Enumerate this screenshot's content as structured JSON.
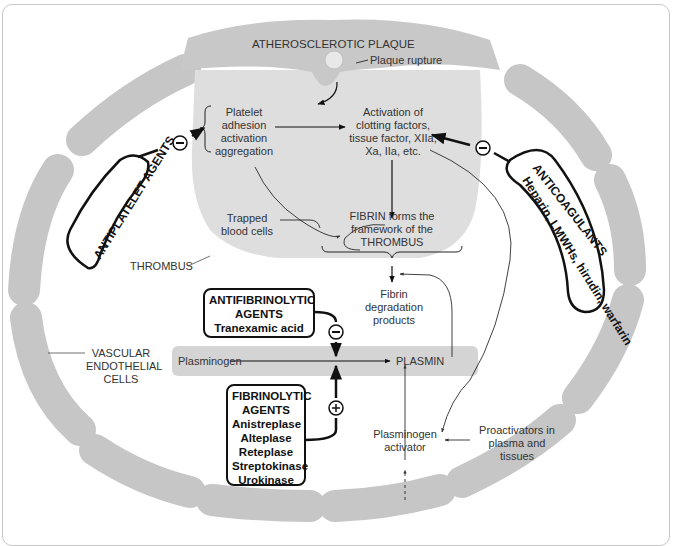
{
  "diagram": {
    "title": "ATHEROSCLEROTIC PLAQUE",
    "labels": {
      "plaque_rupture": "Plaque rupture",
      "platelet": [
        "Platelet",
        "adhesion",
        "activation",
        "aggregation"
      ],
      "activation": [
        "Activation of",
        "clotting factors,",
        "tissue factor, XIIa,",
        "Xa, IIa, etc."
      ],
      "trapped": [
        "Trapped",
        "blood cells"
      ],
      "fibrin": [
        "FIBRIN forms the",
        "framework of the",
        "THROMBUS"
      ],
      "thrombus": "THROMBUS",
      "fdp": [
        "Fibrin",
        "degradation",
        "products"
      ],
      "vascular": [
        "VASCULAR",
        "ENDOTHELIAL",
        "CELLS"
      ],
      "plasminogen": "Plasminogen",
      "plasmin": "PLASMIN",
      "plasminogen_activator": [
        "Plasminogen",
        "activator"
      ],
      "proactivators": [
        "Proactivators in",
        "plasma and",
        "tissues"
      ]
    },
    "drug_boxes": {
      "antiplatelet": "ANTIPLATELET AGENTS",
      "anticoagulants": {
        "title": "ANTICOAGULANTS",
        "drugs": "Heparin, LMWHs, hirudin, warfarin"
      },
      "antifibrinolytic": {
        "lines": [
          "ANTIFIBRINOLYTIC",
          "AGENTS",
          "Tranexamic acid"
        ]
      },
      "fibrinolytic": {
        "lines": [
          "FIBRINOLYTIC",
          "AGENTS",
          "Anistreplase",
          "Alteplase",
          "Reteplase",
          "Streptokinase",
          "Urokinase"
        ]
      }
    },
    "symbols": {
      "inhibit": "−",
      "stimulate": "+"
    },
    "colors": {
      "plaque": "#c8c8c8",
      "thrombus": "#dedede",
      "cells": "#c4c4c4",
      "band": "#d4d4d4",
      "ink": "#111111"
    }
  }
}
